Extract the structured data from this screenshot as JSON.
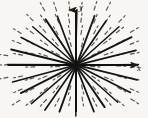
{
  "figure": {
    "name": "direction-field-radial",
    "background_color": "#f7f6f3",
    "ink_color": "#1a1a1a",
    "width": 148,
    "height": 118
  },
  "axes": {
    "origin": {
      "x": 76,
      "y": 65
    },
    "x_axis": {
      "label": "x",
      "label_position": {
        "x": 137,
        "y": 64
      },
      "start": {
        "x": 8,
        "y": 65
      },
      "end": {
        "x": 138,
        "y": 65
      },
      "arrow": "right"
    },
    "y_axis": {
      "label": "y",
      "label_position": {
        "x": 79,
        "y": 3
      },
      "start": {
        "x": 76,
        "y": 112
      },
      "end": {
        "x": 76,
        "y": 10
      },
      "arrow": "up"
    }
  },
  "chart_data": {
    "type": "scatter",
    "xlabel": "x",
    "ylabel": "y",
    "grid": false,
    "legend": null,
    "xlim": [
      -68,
      62
    ],
    "ylim": [
      -47,
      55
    ],
    "rays": [
      {
        "angle_deg": 0,
        "length": 62,
        "style": "solid"
      },
      {
        "angle_deg": 14,
        "length": 62,
        "style": "solid"
      },
      {
        "angle_deg": 27,
        "length": 62,
        "style": "solid"
      },
      {
        "angle_deg": 41,
        "length": 58,
        "style": "solid"
      },
      {
        "angle_deg": 56,
        "length": 54,
        "style": "solid"
      },
      {
        "angle_deg": 70,
        "length": 52,
        "style": "solid"
      },
      {
        "angle_deg": 90,
        "length": 55,
        "style": "solid"
      },
      {
        "angle_deg": 110,
        "length": 52,
        "style": "solid"
      },
      {
        "angle_deg": 124,
        "length": 54,
        "style": "solid"
      },
      {
        "angle_deg": 139,
        "length": 58,
        "style": "solid"
      },
      {
        "angle_deg": 153,
        "length": 62,
        "style": "solid"
      },
      {
        "angle_deg": 166,
        "length": 66,
        "style": "solid"
      },
      {
        "angle_deg": 180,
        "length": 68,
        "style": "solid"
      },
      {
        "angle_deg": 194,
        "length": 66,
        "style": "solid"
      },
      {
        "angle_deg": 207,
        "length": 62,
        "style": "solid"
      },
      {
        "angle_deg": 221,
        "length": 58,
        "style": "solid"
      },
      {
        "angle_deg": 236,
        "length": 54,
        "style": "solid"
      },
      {
        "angle_deg": 250,
        "length": 50,
        "style": "solid"
      },
      {
        "angle_deg": 270,
        "length": 50,
        "style": "solid"
      },
      {
        "angle_deg": 290,
        "length": 50,
        "style": "solid"
      },
      {
        "angle_deg": 304,
        "length": 52,
        "style": "solid"
      },
      {
        "angle_deg": 318,
        "length": 56,
        "style": "solid"
      },
      {
        "angle_deg": 333,
        "length": 60,
        "style": "solid"
      },
      {
        "angle_deg": 347,
        "length": 62,
        "style": "solid"
      }
    ],
    "tick_grid": {
      "style": "dashed",
      "tick_length": 9,
      "spacing_x": 13,
      "spacing_y": 12,
      "note": "Each short dash is tangent to the ray joining it to the origin."
    }
  }
}
